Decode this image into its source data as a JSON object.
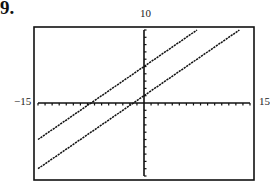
{
  "problem": {
    "number": "9."
  },
  "chart_data": {
    "type": "line",
    "title": "",
    "xlabel": "",
    "ylabel": "",
    "xlim": [
      -15,
      15
    ],
    "ylim": [
      -10,
      10
    ],
    "xscale": 1,
    "yscale": 1,
    "grid": false,
    "legend": null,
    "window_labels": {
      "xmin": "−15",
      "xmax": "15",
      "ymax": "10"
    },
    "series": [
      {
        "name": "upper line",
        "slope": 0.6667,
        "intercept": 5,
        "x": [
          -15,
          7.5
        ],
        "y": [
          -5,
          10
        ]
      },
      {
        "name": "lower line",
        "slope": 0.6667,
        "intercept": 1,
        "x": [
          -15,
          13.5
        ],
        "y": [
          -9,
          10
        ]
      }
    ],
    "annotations": [
      "Two parallel lines on graphing-calculator viewing window, tick marks every 1 unit"
    ]
  },
  "colors": {
    "line": "#111111",
    "frame": "#111111",
    "background": "#ffffff"
  }
}
